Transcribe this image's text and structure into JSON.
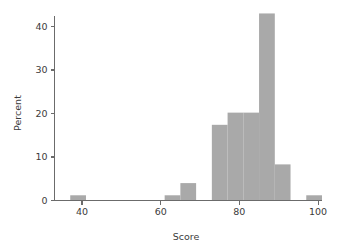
{
  "chart_data": {
    "type": "bar",
    "title": "",
    "subtitle": "",
    "xlabel": "Score",
    "ylabel": "Percent",
    "xlim": [
      33,
      101
    ],
    "ylim": [
      0,
      44
    ],
    "xticks": [
      40,
      60,
      80,
      100
    ],
    "yticks": [
      0,
      10,
      20,
      30,
      40
    ],
    "grid": false,
    "legend": null,
    "bar_color": "#a9a9a9",
    "axis_color": "#6b6b6b",
    "text_color": "#3b3b3b",
    "background_color": "#ffffff",
    "bin_width": 4,
    "bin_starts": [
      37,
      41,
      45,
      49,
      53,
      57,
      61,
      65,
      69,
      73,
      77,
      81,
      85,
      89,
      93,
      97
    ],
    "categories": [
      "37-41",
      "41-45",
      "45-49",
      "49-53",
      "53-57",
      "57-61",
      "61-65",
      "65-69",
      "69-73",
      "73-77",
      "77-81",
      "81-85",
      "85-89",
      "89-93",
      "93-97",
      "97-101"
    ],
    "values": [
      1.2,
      0,
      0,
      0,
      0,
      0,
      1.2,
      4.0,
      0,
      17.4,
      20.2,
      20.2,
      43.0,
      8.3,
      0,
      1.2
    ]
  },
  "axis_labels": {
    "x_title": "Score",
    "y_title": "Percent",
    "x_tick_labels": [
      "40",
      "60",
      "80",
      "100"
    ],
    "y_tick_labels": [
      "0",
      "10",
      "20",
      "30",
      "40"
    ]
  }
}
